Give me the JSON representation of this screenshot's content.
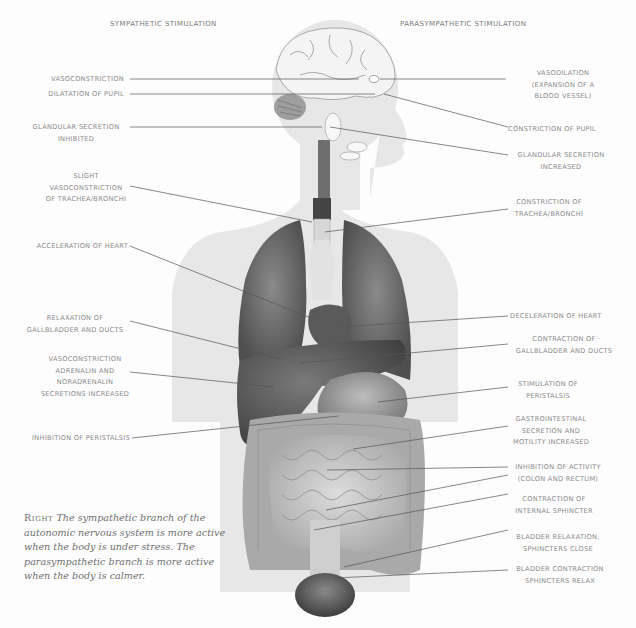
{
  "diagram": {
    "title_left": "Sympathetic Stimulation",
    "title_right": "Parasympathetic Stimulation",
    "sympathetic_labels": [
      {
        "id": "vasoconstriction",
        "text": "Vasoconstriction"
      },
      {
        "id": "dilatation-pupil",
        "text": "Dilatation of pupil"
      },
      {
        "id": "glandular-inhibited",
        "text": "Glandular secretion\ninhibited"
      },
      {
        "id": "slight-vasoconstriction",
        "text": "Slight\nvasoconstriction\nof trachea/bronchi"
      },
      {
        "id": "acceleration-heart",
        "text": "Acceleration of heart"
      },
      {
        "id": "relaxation-gallbladder",
        "text": "Relaxation of\ngallbladder and ducts"
      },
      {
        "id": "vasoconstriction-adrenalin",
        "text": "Vasoconstriction\nadrenalin and\nnoradrenalin\nsecretions increased"
      },
      {
        "id": "inhibition-peristalsis",
        "text": "Inhibition of peristalsis"
      }
    ],
    "parasympathetic_labels": [
      {
        "id": "vasodilation",
        "text": "Vasodilation\n(expansion of a\nblood vessel)"
      },
      {
        "id": "constriction-pupil",
        "text": "Constriction of pupil"
      },
      {
        "id": "glandular-increased",
        "text": "Glandular secretion\nincreased"
      },
      {
        "id": "constriction-trachea",
        "text": "Constriction of\ntrachea/bronchi"
      },
      {
        "id": "deceleration-heart",
        "text": "Deceleration of heart"
      },
      {
        "id": "contraction-gallbladder",
        "text": "Contraction of\ngallbladder and ducts"
      },
      {
        "id": "stimulation-peristalsis",
        "text": "Stimulation of\nperistalsis"
      },
      {
        "id": "gi-secretion",
        "text": "Gastrointestinal\nsecretion and\nmotility increased"
      },
      {
        "id": "inhibition-activity",
        "text": "Inhibition of activity\n(colon and rectum)"
      },
      {
        "id": "contraction-sphincter",
        "text": "Contraction of\ninternal sphincter"
      },
      {
        "id": "bladder-relaxation",
        "text": "Bladder relaxation,\nsphincters close"
      },
      {
        "id": "bladder-contraction",
        "text": "Bladder contraction\nsphincters relax"
      }
    ],
    "caption": {
      "lead": "Right",
      "text": "The sympathetic branch of the autonomic nervous system is more active when the body is under stress. The parasympathetic branch is more active when the body is calmer."
    },
    "colors": {
      "body_silhouette": "#e6e6e6",
      "organ_dark": "#5e5e5e",
      "organ_mid": "#8c8c8c",
      "organ_light": "#d0d0d0",
      "label_text": "#8a8a8a",
      "leader_line": "#555555"
    }
  }
}
